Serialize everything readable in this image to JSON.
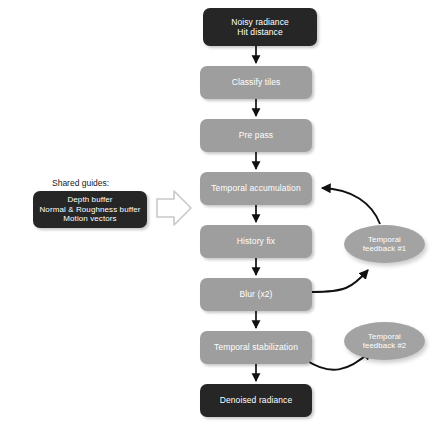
{
  "diagram": {
    "colors": {
      "dark_node": "#262626",
      "gray_node": "#9e9e9e",
      "ellipse_node": "#a3a3a3",
      "edge": "#111111",
      "block_arrow_stroke": "#c9c9c9",
      "background": "#ffffff",
      "node_text": "#ffffff",
      "caption_text": "#1a1a1a"
    },
    "pipeline": [
      {
        "id": "noisy-radiance",
        "label": "Noisy radiance\nHit distance",
        "style": "dark",
        "x": 203,
        "y": 8,
        "w": 114,
        "h": 38,
        "font": 8.5
      },
      {
        "id": "classify-tiles",
        "label": "Classify tiles",
        "style": "gray",
        "x": 200,
        "y": 66,
        "w": 112,
        "h": 33,
        "font": 8.5
      },
      {
        "id": "pre-pass",
        "label": "Pre pass",
        "style": "gray",
        "x": 200,
        "y": 119,
        "w": 112,
        "h": 33,
        "font": 8.5
      },
      {
        "id": "temporal-accumulation",
        "label": "Temporal accumulation",
        "style": "gray",
        "x": 200,
        "y": 172,
        "w": 112,
        "h": 33,
        "font": 8.5
      },
      {
        "id": "history-fix",
        "label": "History fix",
        "style": "gray",
        "x": 200,
        "y": 225,
        "w": 112,
        "h": 33,
        "font": 8.5
      },
      {
        "id": "blur-x2",
        "label": "Blur (x2)",
        "style": "gray",
        "x": 200,
        "y": 278,
        "w": 112,
        "h": 33,
        "font": 8.5
      },
      {
        "id": "temporal-stabilization",
        "label": "Temporal stabilization",
        "style": "gray",
        "x": 200,
        "y": 331,
        "w": 112,
        "h": 33,
        "font": 8.5
      },
      {
        "id": "denoised-radiance",
        "label": "Denoised radiance",
        "style": "dark",
        "x": 200,
        "y": 384,
        "w": 112,
        "h": 33,
        "font": 8.5
      }
    ],
    "feedback": [
      {
        "id": "temporal-feedback-1",
        "label": "Temporal\nfeedback #1",
        "style": "ellipse",
        "x": 344,
        "y": 225,
        "w": 81,
        "h": 38,
        "font": 7.8
      },
      {
        "id": "temporal-feedback-2",
        "label": "Temporal\nfeedback #2",
        "style": "ellipse",
        "x": 344,
        "y": 322,
        "w": 81,
        "h": 38,
        "font": 7.8
      }
    ],
    "shared_guides": {
      "caption": "Shared guides:",
      "caption_x": 52,
      "caption_y": 178,
      "caption_font": 8.5,
      "box": {
        "id": "shared-guides-box",
        "label": "Depth buffer\nNormal & Roughness buffer\nMotion vectors",
        "style": "dark",
        "x": 33,
        "y": 191,
        "w": 114,
        "h": 37,
        "font": 8.0
      }
    }
  }
}
